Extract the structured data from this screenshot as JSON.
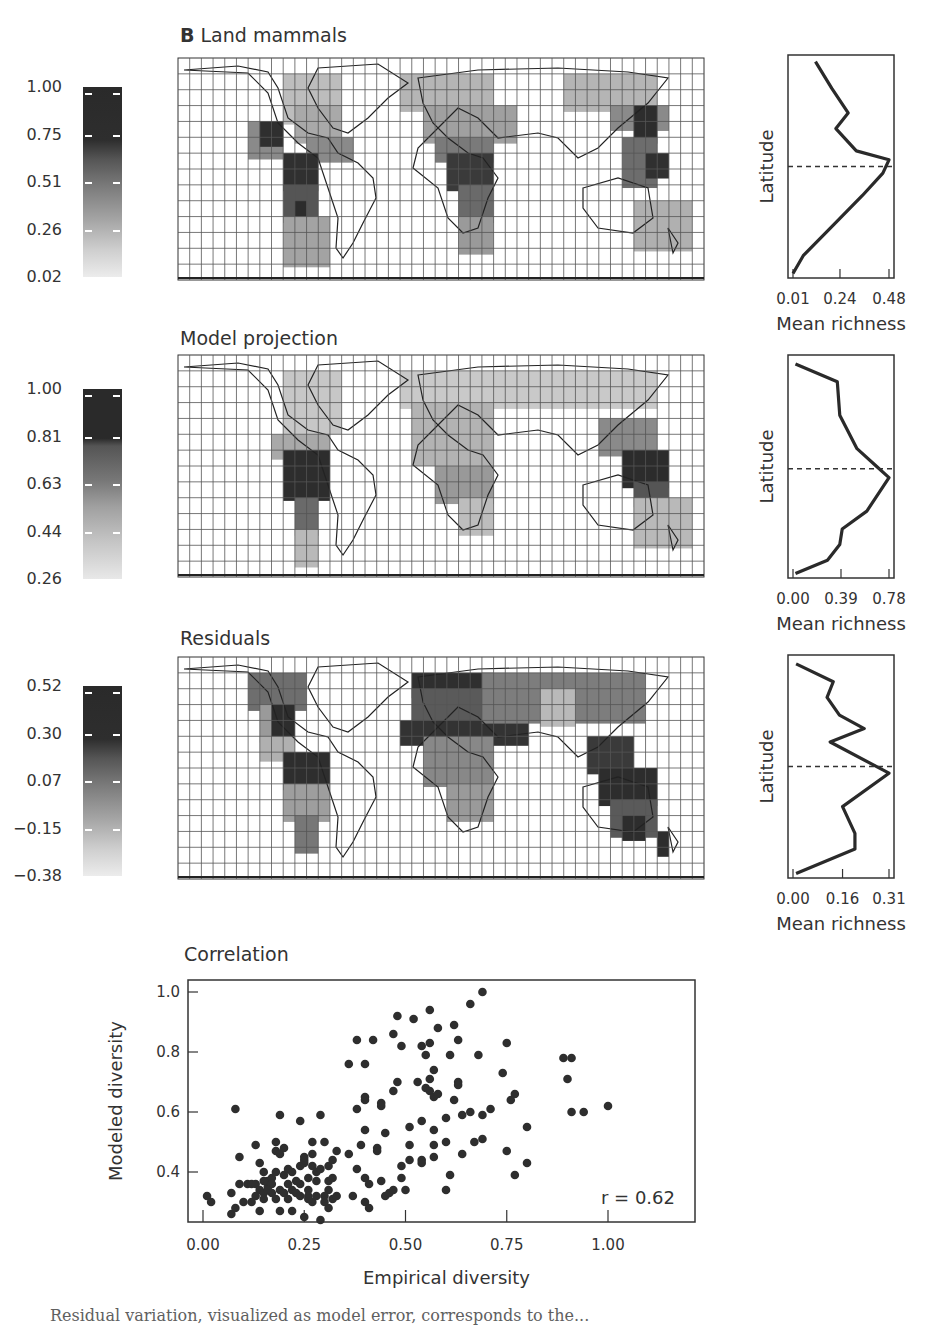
{
  "figure_label": "B",
  "figure_title": "Land mammals",
  "panels": [
    {
      "id": "empirical",
      "title": "Land mammals",
      "colorbar": {
        "ticks": [
          "1.00",
          "0.75",
          "0.51",
          "0.26",
          "0.02"
        ]
      },
      "profile": {
        "ylabel": "Latitude",
        "xlabel": "Mean richness",
        "xticks": [
          "0.01",
          "0.24",
          "0.48"
        ]
      }
    },
    {
      "id": "model",
      "title": "Model projection",
      "colorbar": {
        "ticks": [
          "1.00",
          "0.81",
          "0.63",
          "0.44",
          "0.26"
        ]
      },
      "profile": {
        "ylabel": "Latitude",
        "xlabel": "Mean richness",
        "xticks": [
          "0.00",
          "0.39",
          "0.78"
        ]
      }
    },
    {
      "id": "residuals",
      "title": "Residuals",
      "colorbar": {
        "ticks": [
          "0.52",
          "0.30",
          "0.07",
          "−0.15",
          "−0.38"
        ]
      },
      "profile": {
        "ylabel": "Latitude",
        "xlabel": "Mean richness",
        "xticks": [
          "0.00",
          "0.16",
          "0.31"
        ]
      }
    }
  ],
  "scatter": {
    "title": "Correlation",
    "xlabel": "Empirical diversity",
    "ylabel": "Modeled diversity",
    "xticks": [
      "0.00",
      "0.25",
      "0.50",
      "0.75",
      "1.00"
    ],
    "yticks": [
      "1.0",
      "0.8",
      "0.6",
      "0.4"
    ],
    "annotation": "r =  0.62"
  },
  "caption_fragment": "Residual variation, visualized as model error, corresponds to the...",
  "chart_data": [
    {
      "type": "heatmap",
      "title": "Land mammals",
      "colorbar_ticks": [
        1.0,
        0.75,
        0.51,
        0.26,
        0.02
      ],
      "grid": {
        "cols": 45,
        "rows": 14
      },
      "notes": "Global equal-area grid map of normalized mammal species richness; highest values in Amazonia, Central Africa, SE Asia."
    },
    {
      "type": "line",
      "title": "Land mammals latitude profile",
      "xlabel": "Mean richness",
      "ylabel": "Latitude",
      "xticks": [
        0.01,
        0.24,
        0.48
      ],
      "series": [
        {
          "name": "profile",
          "x": [
            0.12,
            0.2,
            0.28,
            0.22,
            0.32,
            0.48,
            0.45,
            0.35,
            0.2,
            0.06,
            0.01
          ],
          "y_rel": [
            0.03,
            0.15,
            0.26,
            0.33,
            0.43,
            0.47,
            0.53,
            0.63,
            0.77,
            0.9,
            0.98
          ]
        }
      ],
      "dashed_line_y_rel": 0.5
    },
    {
      "type": "heatmap",
      "title": "Model projection",
      "colorbar_ticks": [
        1.0,
        0.81,
        0.63,
        0.44,
        0.26
      ],
      "grid": {
        "cols": 45,
        "rows": 14
      }
    },
    {
      "type": "line",
      "title": "Model projection latitude profile",
      "xlabel": "Mean richness",
      "ylabel": "Latitude",
      "xticks": [
        0.0,
        0.39,
        0.78
      ],
      "series": [
        {
          "name": "profile",
          "x": [
            0.02,
            0.36,
            0.38,
            0.52,
            0.68,
            0.78,
            0.6,
            0.4,
            0.38,
            0.28,
            0.02
          ],
          "y_rel": [
            0.04,
            0.12,
            0.27,
            0.42,
            0.5,
            0.55,
            0.7,
            0.78,
            0.85,
            0.92,
            0.98
          ]
        }
      ],
      "dashed_line_y_rel": 0.51
    },
    {
      "type": "heatmap",
      "title": "Residuals",
      "colorbar_ticks": [
        0.52,
        0.3,
        0.07,
        -0.15,
        -0.38
      ],
      "grid": {
        "cols": 45,
        "rows": 14
      }
    },
    {
      "type": "line",
      "title": "Residuals latitude profile",
      "xlabel": "Mean richness",
      "ylabel": "Latitude",
      "xticks": [
        0.0,
        0.16,
        0.31
      ],
      "series": [
        {
          "name": "profile",
          "x": [
            0.01,
            0.13,
            0.11,
            0.15,
            0.23,
            0.12,
            0.31,
            0.16,
            0.2,
            0.2,
            0.01
          ],
          "y_rel": [
            0.04,
            0.12,
            0.19,
            0.27,
            0.33,
            0.39,
            0.53,
            0.68,
            0.8,
            0.87,
            0.98
          ]
        }
      ],
      "dashed_line_y_rel": 0.5
    },
    {
      "type": "scatter",
      "title": "Correlation",
      "xlabel": "Empirical diversity",
      "ylabel": "Modeled diversity",
      "xlim": [
        -0.03,
        1.03
      ],
      "ylim": [
        0.24,
        1.04
      ],
      "xticks": [
        0.0,
        0.25,
        0.5,
        0.75,
        1.0
      ],
      "yticks": [
        0.4,
        0.6,
        0.8,
        1.0
      ],
      "annotation": "r = 0.62",
      "points": [
        [
          0.01,
          0.32
        ],
        [
          0.02,
          0.3
        ],
        [
          0.07,
          0.33
        ],
        [
          0.07,
          0.26
        ],
        [
          0.08,
          0.61
        ],
        [
          0.09,
          0.45
        ],
        [
          0.08,
          0.28
        ],
        [
          0.1,
          0.3
        ],
        [
          0.09,
          0.36
        ],
        [
          0.11,
          0.36
        ],
        [
          0.12,
          0.36
        ],
        [
          0.13,
          0.36
        ],
        [
          0.13,
          0.49
        ],
        [
          0.14,
          0.43
        ],
        [
          0.15,
          0.4
        ],
        [
          0.14,
          0.34
        ],
        [
          0.15,
          0.33
        ],
        [
          0.16,
          0.35
        ],
        [
          0.15,
          0.31
        ],
        [
          0.16,
          0.37
        ],
        [
          0.17,
          0.38
        ],
        [
          0.17,
          0.36
        ],
        [
          0.18,
          0.4
        ],
        [
          0.18,
          0.47
        ],
        [
          0.18,
          0.5
        ],
        [
          0.19,
          0.59
        ],
        [
          0.19,
          0.46
        ],
        [
          0.2,
          0.48
        ],
        [
          0.2,
          0.39
        ],
        [
          0.19,
          0.34
        ],
        [
          0.2,
          0.33
        ],
        [
          0.21,
          0.31
        ],
        [
          0.14,
          0.27
        ],
        [
          0.19,
          0.27
        ],
        [
          0.21,
          0.41
        ],
        [
          0.22,
          0.4
        ],
        [
          0.22,
          0.34
        ],
        [
          0.23,
          0.33
        ],
        [
          0.24,
          0.32
        ],
        [
          0.24,
          0.36
        ],
        [
          0.24,
          0.42
        ],
        [
          0.25,
          0.43
        ],
        [
          0.25,
          0.44
        ],
        [
          0.25,
          0.45
        ],
        [
          0.24,
          0.57
        ],
        [
          0.22,
          0.27
        ],
        [
          0.25,
          0.25
        ],
        [
          0.26,
          0.38
        ],
        [
          0.26,
          0.34
        ],
        [
          0.27,
          0.5
        ],
        [
          0.27,
          0.46
        ],
        [
          0.27,
          0.42
        ],
        [
          0.28,
          0.4
        ],
        [
          0.28,
          0.37
        ],
        [
          0.27,
          0.3
        ],
        [
          0.29,
          0.59
        ],
        [
          0.29,
          0.41
        ],
        [
          0.29,
          0.24
        ],
        [
          0.3,
          0.5
        ],
        [
          0.3,
          0.3
        ],
        [
          0.31,
          0.37
        ],
        [
          0.31,
          0.34
        ],
        [
          0.31,
          0.42
        ],
        [
          0.32,
          0.44
        ],
        [
          0.32,
          0.38
        ],
        [
          0.31,
          0.28
        ],
        [
          0.32,
          0.31
        ],
        [
          0.33,
          0.47
        ],
        [
          0.33,
          0.32
        ],
        [
          0.36,
          0.46
        ],
        [
          0.36,
          0.76
        ],
        [
          0.37,
          0.32
        ],
        [
          0.38,
          0.84
        ],
        [
          0.38,
          0.61
        ],
        [
          0.38,
          0.41
        ],
        [
          0.39,
          0.49
        ],
        [
          0.4,
          0.54
        ],
        [
          0.4,
          0.64
        ],
        [
          0.4,
          0.65
        ],
        [
          0.4,
          0.76
        ],
        [
          0.4,
          0.38
        ],
        [
          0.4,
          0.3
        ],
        [
          0.41,
          0.28
        ],
        [
          0.41,
          0.36
        ],
        [
          0.42,
          0.84
        ],
        [
          0.43,
          0.47
        ],
        [
          0.43,
          0.48
        ],
        [
          0.44,
          0.37
        ],
        [
          0.44,
          0.63
        ],
        [
          0.44,
          0.62
        ],
        [
          0.45,
          0.53
        ],
        [
          0.45,
          0.32
        ],
        [
          0.46,
          0.33
        ],
        [
          0.47,
          0.67
        ],
        [
          0.47,
          0.86
        ],
        [
          0.47,
          0.34
        ],
        [
          0.48,
          0.7
        ],
        [
          0.48,
          0.92
        ],
        [
          0.49,
          0.82
        ],
        [
          0.49,
          0.42
        ],
        [
          0.49,
          0.38
        ],
        [
          0.5,
          0.34
        ],
        [
          0.51,
          0.44
        ],
        [
          0.51,
          0.49
        ],
        [
          0.51,
          0.55
        ],
        [
          0.52,
          0.91
        ],
        [
          0.53,
          0.7
        ],
        [
          0.54,
          0.57
        ],
        [
          0.54,
          0.82
        ],
        [
          0.54,
          0.44
        ],
        [
          0.54,
          0.43
        ],
        [
          0.55,
          0.79
        ],
        [
          0.55,
          0.68
        ],
        [
          0.56,
          0.83
        ],
        [
          0.56,
          0.94
        ],
        [
          0.56,
          0.67
        ],
        [
          0.56,
          0.71
        ],
        [
          0.57,
          0.54
        ],
        [
          0.57,
          0.49
        ],
        [
          0.57,
          0.74
        ],
        [
          0.57,
          0.65
        ],
        [
          0.58,
          0.66
        ],
        [
          0.58,
          0.88
        ],
        [
          0.57,
          0.45
        ],
        [
          0.6,
          0.5
        ],
        [
          0.6,
          0.58
        ],
        [
          0.61,
          0.39
        ],
        [
          0.61,
          0.79
        ],
        [
          0.62,
          0.89
        ],
        [
          0.62,
          0.64
        ],
        [
          0.63,
          0.7
        ],
        [
          0.63,
          0.69
        ],
        [
          0.63,
          0.84
        ],
        [
          0.64,
          0.46
        ],
        [
          0.64,
          0.59
        ],
        [
          0.66,
          0.96
        ],
        [
          0.66,
          0.6
        ],
        [
          0.67,
          0.5
        ],
        [
          0.68,
          0.79
        ],
        [
          0.69,
          1.0
        ],
        [
          0.69,
          0.51
        ],
        [
          0.69,
          0.59
        ],
        [
          0.71,
          0.61
        ],
        [
          0.74,
          0.73
        ],
        [
          0.75,
          0.83
        ],
        [
          0.75,
          0.47
        ],
        [
          0.76,
          0.64
        ],
        [
          0.77,
          0.66
        ],
        [
          0.77,
          0.39
        ],
        [
          0.8,
          0.55
        ],
        [
          0.8,
          0.43
        ],
        [
          0.6,
          0.34
        ],
        [
          0.89,
          0.78
        ],
        [
          0.9,
          0.71
        ],
        [
          0.91,
          0.78
        ],
        [
          0.91,
          0.6
        ],
        [
          0.94,
          0.6
        ],
        [
          1.0,
          0.62
        ],
        [
          0.12,
          0.3
        ],
        [
          0.13,
          0.32
        ],
        [
          0.15,
          0.37
        ],
        [
          0.16,
          0.34
        ],
        [
          0.17,
          0.33
        ],
        [
          0.18,
          0.31
        ],
        [
          0.21,
          0.36
        ],
        [
          0.23,
          0.37
        ],
        [
          0.26,
          0.32
        ],
        [
          0.28,
          0.32
        ],
        [
          0.3,
          0.32
        ],
        [
          0.26,
          0.31
        ]
      ]
    }
  ]
}
